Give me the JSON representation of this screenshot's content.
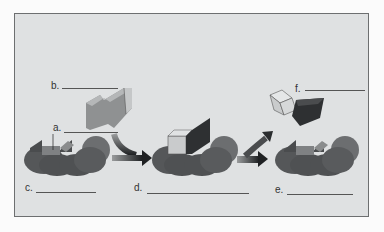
{
  "diagram": {
    "labels": [
      {
        "id": "a",
        "text": "a."
      },
      {
        "id": "b",
        "text": "b."
      },
      {
        "id": "c",
        "text": "c."
      },
      {
        "id": "d",
        "text": "d."
      },
      {
        "id": "e",
        "text": "e."
      },
      {
        "id": "f",
        "text": "f."
      }
    ],
    "blanks": {
      "a": "",
      "b": "",
      "c": "",
      "d": "",
      "e": "",
      "f": ""
    },
    "colors": {
      "background": "#dfe1e2",
      "enzyme": "#5a5c5e",
      "enzyme_dark": "#3f4143",
      "substrate": "#8d8f90",
      "product_light": "#c9cbcc",
      "product_dark": "#2e3032",
      "arrow": "#3a3c3e"
    }
  }
}
